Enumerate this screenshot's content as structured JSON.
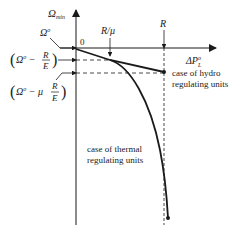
{
  "diagram": {
    "y_axis_label": "Ω",
    "y_axis_sub": "min",
    "x_axis_label": "ΔP",
    "x_axis_sup": "o",
    "x_axis_sub": "L",
    "origin_label": "0",
    "omega0_label": "Ω",
    "omega0_sup": "o",
    "tick_r_mu": "R/μ",
    "tick_r": "R",
    "level1": {
      "open": "(",
      "omega": "Ω",
      "sup": "o",
      "minus": " − ",
      "num": "R",
      "den": "E",
      "close": ")"
    },
    "level2": {
      "open": "(",
      "omega": "Ω",
      "sup": "o",
      "minus": " − μ",
      "num": "R",
      "den": "E",
      "close": ")"
    },
    "hydro_line1": "case of hydro",
    "hydro_line2": "regulating units",
    "thermal_line1": "case of thermal",
    "thermal_line2": "regulating units",
    "colors": {
      "ink": "#1a1a1a"
    }
  }
}
